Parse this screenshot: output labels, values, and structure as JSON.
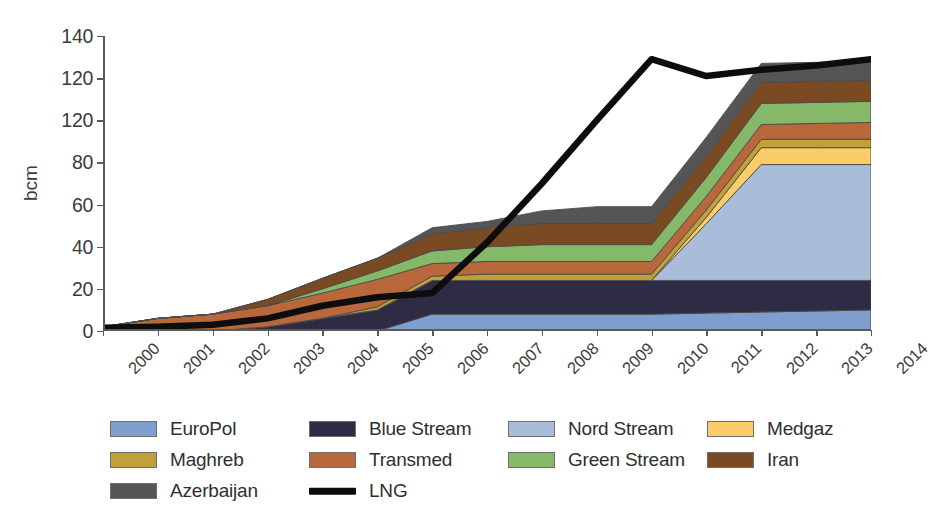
{
  "chart_data": {
    "type": "area",
    "title": "",
    "subtitle": "",
    "xlabel": "",
    "ylabel": "bcm",
    "stacked": true,
    "grid": false,
    "legend_position": "bottom",
    "xlim": [
      2000,
      2014
    ],
    "ylim": [
      0,
      140
    ],
    "ytick_labels": [
      "0",
      "20",
      "40",
      "60",
      "80",
      "120",
      "120",
      "140"
    ],
    "ytick_values": [
      0,
      20,
      40,
      60,
      80,
      100,
      120,
      140
    ],
    "ytick_note": "third label from top is printed as 120 in the source image where 100 would be expected",
    "categories": [
      "2000",
      "2001",
      "2002",
      "2003",
      "2004",
      "2005",
      "2006",
      "2007",
      "2008",
      "2009",
      "2010",
      "2011",
      "2012",
      "2013",
      "2014"
    ],
    "x": [
      2000,
      2001,
      2002,
      2003,
      2004,
      2005,
      2006,
      2007,
      2008,
      2009,
      2010,
      2011,
      2012,
      2013,
      2014
    ],
    "series": [
      {
        "name": "EuroPol",
        "color": "#7e9fcd",
        "type": "area",
        "values": [
          0,
          0,
          0,
          0,
          0,
          0,
          8,
          8,
          8,
          8,
          8,
          8.5,
          9,
          9.5,
          10
        ]
      },
      {
        "name": "Blue Stream",
        "color": "#2e2b44",
        "type": "area",
        "values": [
          0,
          0,
          0,
          2,
          6,
          10,
          16,
          16,
          16,
          16,
          16,
          15.5,
          15,
          14.5,
          14
        ]
      },
      {
        "name": "Nord Stream",
        "color": "#a9bcd9",
        "type": "area",
        "values": [
          0,
          0,
          0,
          0,
          0,
          0,
          0,
          0,
          0,
          0,
          0,
          27,
          55,
          55,
          55
        ]
      },
      {
        "name": "Medgaz",
        "color": "#fbcd6a",
        "type": "area",
        "values": [
          0,
          0,
          0,
          0,
          0,
          0,
          0,
          0,
          0,
          0,
          0,
          3,
          8,
          8,
          8
        ]
      },
      {
        "name": "Maghreb",
        "color": "#c0a03b",
        "type": "area",
        "values": [
          0,
          0,
          0,
          0,
          0,
          1.5,
          2,
          3,
          3,
          3,
          3,
          3.5,
          4,
          4,
          4
        ]
      },
      {
        "name": "Transmed",
        "color": "#b9683c",
        "type": "area",
        "values": [
          2,
          6,
          8,
          10,
          12,
          13,
          6,
          6,
          6,
          6,
          6,
          6.5,
          7,
          7.5,
          8
        ]
      },
      {
        "name": "Green Stream",
        "color": "#85b868",
        "type": "area",
        "values": [
          0,
          0,
          0,
          0,
          2,
          4,
          6,
          7,
          8,
          8,
          8,
          9,
          10,
          10,
          10
        ]
      },
      {
        "name": "Iran",
        "color": "#7a4a22",
        "type": "area",
        "values": [
          0,
          0,
          0,
          3,
          5,
          6,
          8,
          9,
          10,
          10,
          10,
          10,
          10,
          10,
          10
        ]
      },
      {
        "name": "Azerbaijan",
        "color": "#555555",
        "type": "area",
        "values": [
          0,
          0,
          0,
          0,
          0,
          0,
          3,
          3,
          6,
          8,
          8,
          9,
          9,
          9,
          9
        ]
      },
      {
        "name": "LNG",
        "color": "#0d0d0d",
        "type": "line",
        "values": [
          1.5,
          2,
          3,
          6,
          12,
          16,
          18,
          42,
          70,
          100,
          129,
          121,
          124,
          126,
          129
        ]
      }
    ],
    "stack_totals": [
      2,
      6,
      8,
      15,
      25,
      34.5,
      49,
      52,
      58,
      59,
      59,
      92,
      127,
      127.5,
      128
    ]
  },
  "legend": {
    "rows": [
      [
        {
          "label": "EuroPol",
          "swatch": "area",
          "color": "#7e9fcd"
        },
        {
          "label": "Blue Stream",
          "swatch": "area",
          "color": "#2e2b44"
        },
        {
          "label": "Nord Stream",
          "swatch": "area",
          "color": "#a9bcd9"
        },
        {
          "label": "Medgaz",
          "swatch": "area",
          "color": "#fbcd6a"
        }
      ],
      [
        {
          "label": "Maghreb",
          "swatch": "area",
          "color": "#c0a03b"
        },
        {
          "label": "Transmed",
          "swatch": "area",
          "color": "#b9683c"
        },
        {
          "label": "Green Stream",
          "swatch": "area",
          "color": "#85b868"
        },
        {
          "label": "Iran",
          "swatch": "area",
          "color": "#7a4a22"
        }
      ],
      [
        {
          "label": "Azerbaijan",
          "swatch": "area",
          "color": "#555555"
        },
        {
          "label": "LNG",
          "swatch": "line",
          "color": "#0d0d0d"
        }
      ]
    ]
  }
}
